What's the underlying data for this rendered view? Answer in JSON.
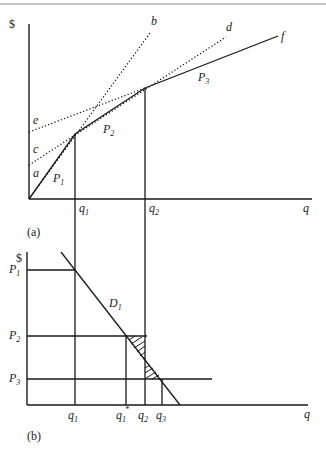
{
  "header_rule": true,
  "panel_a": {
    "caption": "(a)",
    "y_axis_label": "$",
    "x_axis_label": "q",
    "x_ticks": [
      {
        "label": "q",
        "sub": "1"
      },
      {
        "label": "q",
        "sub": "2"
      }
    ],
    "line_labels": {
      "a": "a",
      "b": "b",
      "c": "c",
      "d": "d",
      "e": "e",
      "f": "f"
    },
    "segment_labels": [
      {
        "label": "P",
        "sub": "1"
      },
      {
        "label": "P",
        "sub": "2"
      },
      {
        "label": "P",
        "sub": "3"
      }
    ],
    "description": "Piecewise-linear total outlay schedule with three price blocks P1, P2, P3 and dotted extensions b, d, e/c"
  },
  "panel_b": {
    "caption": "(b)",
    "y_axis_label": "$",
    "x_axis_label": "q",
    "price_levels": [
      {
        "label": "P",
        "sub": "1"
      },
      {
        "label": "P",
        "sub": "2"
      },
      {
        "label": "P",
        "sub": "3"
      }
    ],
    "x_ticks": [
      {
        "label": "q",
        "sub": "1",
        "sup": ""
      },
      {
        "label": "q",
        "sub": "1",
        "sup": "*"
      },
      {
        "label": "q",
        "sub": "2",
        "sup": ""
      },
      {
        "label": "q",
        "sub": "3",
        "sup": ""
      }
    ],
    "demand_label": {
      "label": "D",
      "sub": "1"
    },
    "description": "Demand curve D1 with block prices P1 > P2 > P3; hatched triangles show surplus regions"
  }
}
